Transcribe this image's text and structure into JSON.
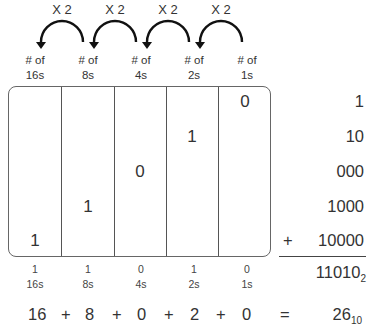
{
  "multipliers": [
    "X 2",
    "X 2",
    "X 2",
    "X 2"
  ],
  "column_headers": [
    {
      "line1": "# of",
      "line2": "16s"
    },
    {
      "line1": "# of",
      "line2": "8s"
    },
    {
      "line1": "# of",
      "line2": "4s"
    },
    {
      "line1": "# of",
      "line2": "2s"
    },
    {
      "line1": "# of",
      "line2": "1s"
    }
  ],
  "table_digits": [
    "1",
    "1",
    "0",
    "1",
    "0"
  ],
  "addends": [
    "1",
    "10",
    "000",
    "1000",
    "10000"
  ],
  "plus_sign": "+",
  "binary_result": {
    "value": "11010",
    "base": "2"
  },
  "bottom_labels": [
    {
      "digit": "1",
      "place": "16s"
    },
    {
      "digit": "1",
      "place": "8s"
    },
    {
      "digit": "0",
      "place": "4s"
    },
    {
      "digit": "1",
      "place": "2s"
    },
    {
      "digit": "0",
      "place": "1s"
    }
  ],
  "equation": {
    "terms": [
      "16",
      "8",
      "0",
      "2",
      "0"
    ],
    "operator": "+",
    "equals": "=",
    "result": {
      "value": "26",
      "base": "10"
    }
  }
}
